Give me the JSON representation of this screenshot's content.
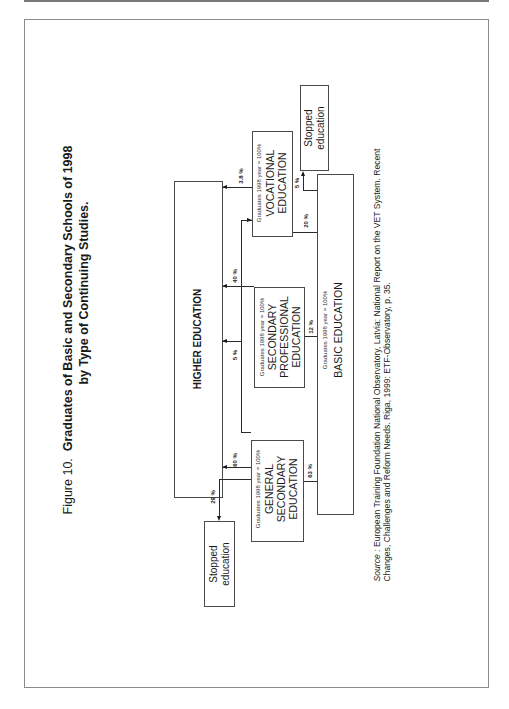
{
  "figure": {
    "number_label": "Figure 10.",
    "title_line1": "Graduates of Basic and Secondary Schools of 1998",
    "title_line2": "by Type of Continuing Studies."
  },
  "nodes": {
    "higher_education": {
      "label": "HIGHER EDUCATION"
    },
    "general_secondary": {
      "note": "Graduates 1998 year = 100%",
      "line1": "GENERAL",
      "line2": "SECONDARY",
      "line3": "EDUCATION"
    },
    "secondary_professional": {
      "note": "Graduates 1998 year = 100%",
      "line1": "SECONDARY",
      "line2": "PROFESSIONAL",
      "line3": "EDUCATION"
    },
    "vocational": {
      "note": "Graduates 1998 year = 100%",
      "line1": "VOCATIONAL",
      "line2": "EDUCATION"
    },
    "basic_education": {
      "note": "Graduates 1998 year = 100%",
      "label": "BASIC EDUCATION"
    },
    "stopped_from_general": {
      "line1": "Stopped",
      "line2": "education"
    },
    "stopped_from_basic": {
      "line1": "Stopped",
      "line2": "education"
    }
  },
  "flows": [
    {
      "from": "GENERAL SECONDARY EDUCATION",
      "to": "HIGHER EDUCATION",
      "label": "60 %"
    },
    {
      "from": "GENERAL SECONDARY EDUCATION",
      "to": "Stopped education",
      "label": "29 %"
    },
    {
      "from": "SECONDARY PROFESSIONAL EDUCATION",
      "to": "HIGHER EDUCATION",
      "label": "40 %"
    },
    {
      "from": "BASIC EDUCATION",
      "to": "HIGHER EDUCATION",
      "label": "5 %"
    },
    {
      "from": "VOCATIONAL EDUCATION",
      "to": "HIGHER EDUCATION",
      "label": "3.8 %"
    },
    {
      "from": "BASIC EDUCATION",
      "to": "GENERAL SECONDARY EDUCATION",
      "label": "63 %"
    },
    {
      "from": "BASIC EDUCATION",
      "to": "SECONDARY PROFESSIONAL EDUCATION",
      "label": "12 %"
    },
    {
      "from": "BASIC EDUCATION",
      "to": "VOCATIONAL EDUCATION",
      "label": "20 %"
    },
    {
      "from": "BASIC EDUCATION",
      "to": "Stopped education",
      "label": "5 %"
    }
  ],
  "source": {
    "prefix": "Source :",
    "line1": " European Training Foundation National Observatory, Latvia:  National Report on the VET System. Recent",
    "line2": "Changes, Challenges and Reform Needs. Riga, 1999:  ETF-Observatory, p. 35."
  }
}
